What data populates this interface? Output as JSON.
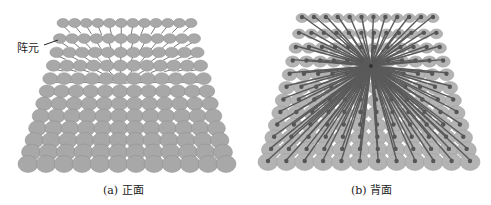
{
  "figure": {
    "panels": [
      {
        "id": "a",
        "caption": "(a) 正面",
        "view": "front",
        "annotation": "阵元",
        "grid": {
          "rows": 12,
          "cols": 12
        }
      },
      {
        "id": "b",
        "caption": "(b) 背面",
        "view": "back",
        "grid": {
          "rows": 12,
          "cols": 12
        }
      }
    ],
    "colors": {
      "element_fill": "#a8a8a8",
      "element_edge": "#8c8c8c",
      "feed_line": "#5a5a5a",
      "background": "#ffffff"
    }
  }
}
